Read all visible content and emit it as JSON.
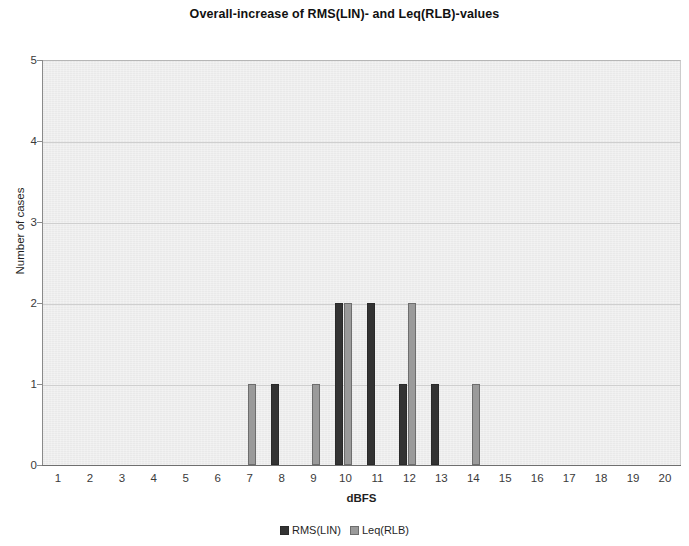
{
  "chart_data": {
    "type": "bar",
    "title": "Overall-increase of RMS(LIN)- and Leq(RLB)-values",
    "xlabel": "dBFS",
    "ylabel": "Number of cases",
    "categories": [
      "1",
      "2",
      "3",
      "4",
      "5",
      "6",
      "7",
      "8",
      "9",
      "10",
      "11",
      "12",
      "13",
      "14",
      "15",
      "16",
      "17",
      "18",
      "19",
      "20"
    ],
    "series": [
      {
        "name": "RMS(LIN)",
        "color": "#333333",
        "values": [
          0,
          0,
          0,
          0,
          0,
          0,
          0,
          1,
          0,
          2,
          2,
          1,
          1,
          0,
          0,
          0,
          0,
          0,
          0,
          0
        ]
      },
      {
        "name": "Leq(RLB)",
        "color": "#9a9a9a",
        "values": [
          0,
          0,
          0,
          0,
          0,
          0,
          1,
          0,
          1,
          2,
          0,
          2,
          0,
          1,
          0,
          0,
          0,
          0,
          0,
          0
        ]
      }
    ],
    "ylim": [
      0,
      5
    ],
    "y_ticks": [
      "0",
      "1",
      "2",
      "3",
      "4",
      "5"
    ],
    "grid": true,
    "grid_axis": "y",
    "legend_position": "bottom",
    "plot_background": "#e9e9e9"
  },
  "legend": {
    "entries": [
      {
        "label": "RMS(LIN)"
      },
      {
        "label": "Leq(RLB)"
      }
    ]
  }
}
